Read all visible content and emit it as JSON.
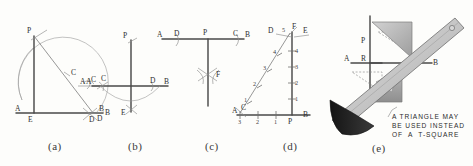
{
  "figure": {
    "background": "#fdfdfb",
    "ink": "#4a4a4a"
  },
  "captions": [
    {
      "key": "a",
      "text": "(a)"
    },
    {
      "key": "b",
      "text": "(b)"
    },
    {
      "key": "c",
      "text": "(c)"
    },
    {
      "key": "d",
      "text": "(d)"
    },
    {
      "key": "e",
      "text": "(e)"
    }
  ],
  "panel_a": {
    "labels": {
      "p": "P",
      "c": "C",
      "a": "A",
      "e": "E",
      "d": "D",
      "b": "B"
    }
  },
  "panel_b": {
    "labels": {
      "p": "P",
      "a": "A",
      "c": "C",
      "d": "D",
      "b": "B",
      "e": "E"
    }
  },
  "panel_c": {
    "labels": {
      "a": "A",
      "d": "D",
      "p": "P",
      "c": "C",
      "b": "B",
      "f": "F"
    }
  },
  "panel_d": {
    "labels": {
      "d": "D",
      "five": "5",
      "f": "F",
      "e": "E",
      "a": "A",
      "c": "C",
      "p": "P",
      "b": "B"
    },
    "diagonal_divisions": [
      "1",
      "2",
      "3",
      "4",
      "5"
    ],
    "vertical_divisions": [
      "1",
      "2",
      "3",
      "4",
      "5"
    ],
    "baseline_divisions": [
      "3",
      "2",
      "1"
    ]
  },
  "panel_e": {
    "labels": {
      "p": "P",
      "r": "R",
      "a": "A",
      "b": "B"
    },
    "note_lines": [
      "A TRIANGLE MAY",
      "BE USED INSTEAD",
      "OF A T-SQUARE"
    ],
    "note_text": "A TRIANGLE MAY\nBE USED INSTEAD\nOF  A  T-SQUARE",
    "colors": {
      "triangle_fill": "#b9b9b9",
      "tsquare_fill": "#cfcfcf",
      "pencil_fill": "#1d1d1d"
    }
  }
}
